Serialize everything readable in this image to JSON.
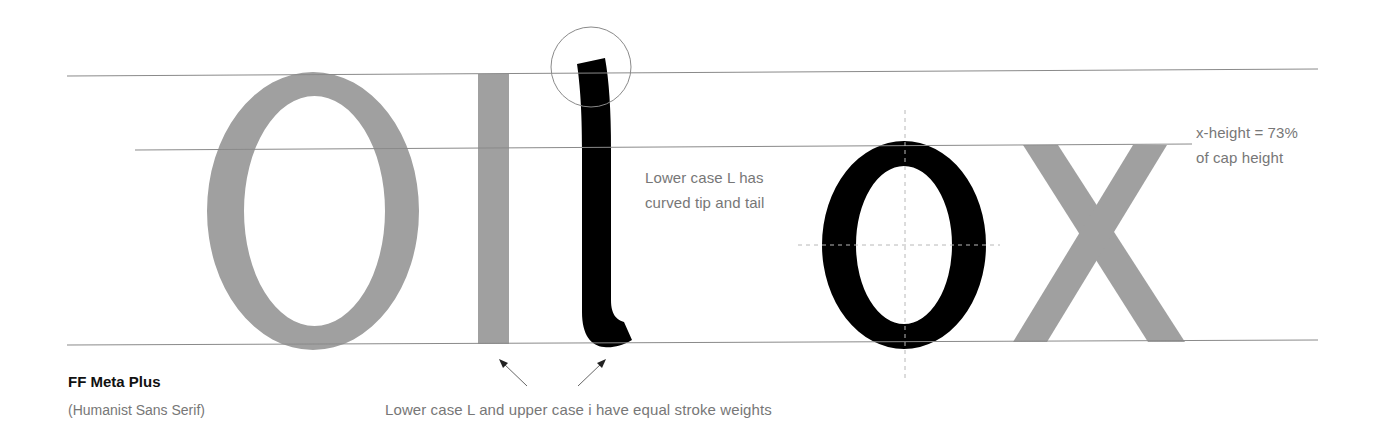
{
  "colors": {
    "gray_glyph": "#a0a0a0",
    "black_glyph": "#000000",
    "guide_line": "#8a8a8a",
    "annotation_text": "#777777",
    "title_text": "#111111",
    "background": "#ffffff"
  },
  "specimen": {
    "glyphs": [
      "O",
      "I",
      "l",
      "o",
      "x"
    ],
    "highlighted_glyphs": [
      "l",
      "o"
    ]
  },
  "guides": {
    "cap_height_line": "cap-height",
    "x_height_line": "x-height",
    "baseline": "baseline"
  },
  "annotations": {
    "lowercase_l_line1": "Lower case L has",
    "lowercase_l_line2": "curved tip and tail",
    "xheight_line1": "x-height = 73%",
    "xheight_line2": "of cap height",
    "stroke_weights": "Lower case L and upper case i have equal stroke weights"
  },
  "font": {
    "name": "FF Meta Plus",
    "classification": "(Humanist Sans Serif)"
  }
}
